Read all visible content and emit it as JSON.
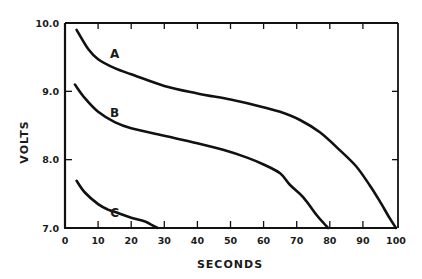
{
  "chart_data": {
    "type": "line",
    "title": "",
    "xlabel": "SECONDS",
    "ylabel": "VOLTS",
    "xlim": [
      0,
      100
    ],
    "ylim": [
      7.0,
      10.0
    ],
    "xticks": [
      0,
      10,
      20,
      30,
      40,
      50,
      60,
      70,
      80,
      90,
      100
    ],
    "xtick_labels": [
      "0",
      "10",
      "20",
      "30",
      "40",
      "50",
      "60",
      "70",
      "80",
      "90",
      "100"
    ],
    "yticks": [
      7.0,
      8.0,
      9.0,
      10.0
    ],
    "ytick_labels": [
      "7.0",
      "8.0",
      "9.0",
      "10.0"
    ],
    "grid": false,
    "legend": "inline curve labels",
    "series": [
      {
        "name": "A",
        "label_pos": {
          "x": 15,
          "y": 9.55
        },
        "x": [
          3.5,
          7,
          10,
          15,
          20,
          30,
          40,
          50,
          59,
          65,
          71,
          77,
          83,
          88,
          92,
          95,
          98,
          100
        ],
        "y": [
          9.9,
          9.62,
          9.47,
          9.34,
          9.25,
          9.08,
          8.97,
          8.88,
          8.78,
          8.7,
          8.58,
          8.4,
          8.14,
          7.9,
          7.63,
          7.4,
          7.15,
          7.0
        ]
      },
      {
        "name": "B",
        "label_pos": {
          "x": 15,
          "y": 8.68
        },
        "x": [
          3,
          6,
          10,
          15,
          20,
          30,
          40,
          48,
          55,
          60,
          65,
          68,
          72,
          76,
          78,
          79.5
        ],
        "y": [
          9.1,
          8.9,
          8.7,
          8.55,
          8.46,
          8.35,
          8.24,
          8.14,
          8.03,
          7.93,
          7.8,
          7.63,
          7.45,
          7.19,
          7.08,
          7.0
        ]
      },
      {
        "name": "C",
        "label_pos": {
          "x": 15,
          "y": 7.22
        },
        "x": [
          3.5,
          6,
          10,
          13,
          16,
          20,
          24,
          26,
          28
        ],
        "y": [
          7.69,
          7.52,
          7.35,
          7.27,
          7.22,
          7.15,
          7.1,
          7.05,
          7.0
        ]
      }
    ]
  }
}
